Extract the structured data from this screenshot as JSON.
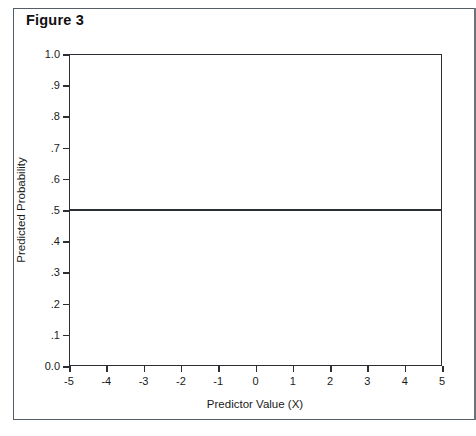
{
  "figure": {
    "title": "Figure 3"
  },
  "chart_data": {
    "type": "line",
    "title": "Figure 3",
    "xlabel": "Predictor Value (X)",
    "ylabel": "Predicted Probability",
    "xlim": [
      -5,
      5
    ],
    "ylim": [
      0.0,
      1.0
    ],
    "grid": false,
    "legend": null,
    "x_ticks": [
      -5,
      -4,
      -3,
      -2,
      -1,
      0,
      1,
      2,
      3,
      4,
      5
    ],
    "x_tick_labels": [
      "-5",
      "-4",
      "-3",
      "-2",
      "-1",
      "0",
      "1",
      "2",
      "3",
      "4",
      "5"
    ],
    "y_ticks": [
      1.0,
      0.9,
      0.8,
      0.7,
      0.6,
      0.5,
      0.4,
      0.3,
      0.2,
      0.1,
      0.0
    ],
    "y_tick_labels": [
      "1.0",
      ".9",
      ".8",
      ".7",
      ".6",
      ".5",
      ".4",
      ".3",
      ".2",
      ".1",
      "0.0"
    ],
    "series": [
      {
        "name": "Predicted probability (flat, slope = 0)",
        "color": "#2b2f33",
        "x": [
          -5,
          -4,
          -3,
          -2,
          -1,
          0,
          1,
          2,
          3,
          4,
          5
        ],
        "values": [
          0.5,
          0.5,
          0.5,
          0.5,
          0.5,
          0.5,
          0.5,
          0.5,
          0.5,
          0.5,
          0.5
        ]
      }
    ]
  }
}
